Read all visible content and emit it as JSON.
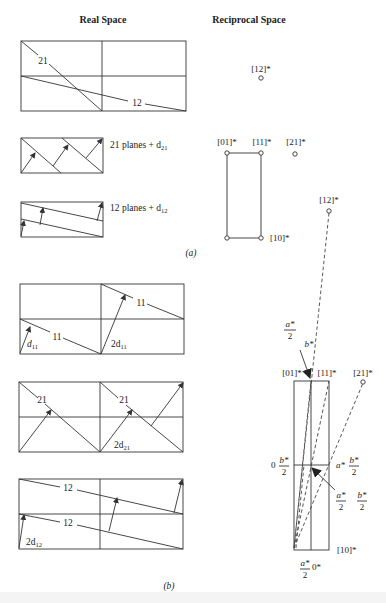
{
  "headers": {
    "real_space": "Real Space",
    "reciprocal_space": "Reciprocal Space"
  },
  "part_a": {
    "caption": "(a)",
    "real": {
      "panel1_labels": [
        "21",
        "12"
      ],
      "panel2_label": "21 planes + d",
      "panel2_sub": "21",
      "panel3_label": "12 planes + d",
      "panel3_sub": "12"
    },
    "reciprocal": {
      "points": [
        {
          "label": "[12]*"
        },
        {
          "label": "[01]*"
        },
        {
          "label": "[11]*"
        },
        {
          "label": "[21]*"
        },
        {
          "label": "[12]*"
        },
        {
          "label": "[10]*"
        }
      ]
    }
  },
  "part_b": {
    "caption": "(b)",
    "real": {
      "panel1_labels": [
        "11",
        "11"
      ],
      "panel1_d": "d",
      "panel1_d_sub": "11",
      "panel1_2d": "2d",
      "panel1_2d_sub": "11",
      "panel2_labels": [
        "21",
        "21"
      ],
      "panel2_2d": "2d",
      "panel2_2d_sub": "21",
      "panel3_labels": [
        "12",
        "12"
      ],
      "panel3_2d": "2d",
      "panel3_2d_sub": "12"
    },
    "reciprocal": {
      "labels": {
        "a_half_num": "a*",
        "a_half_den": "2",
        "b_star": "b*",
        "p01": "[01]*",
        "p11": "[11]*",
        "p21": "[21]*",
        "zero": "0",
        "b_half_num": "b*",
        "b_half_den": "2",
        "a_star": "a*",
        "b_half2_num": "b*",
        "b_half2_den": "2",
        "a_half2_num": "a*",
        "a_half2_den": "2",
        "b_half3_num": "b*",
        "b_half3_den": "2",
        "p10": "[10]*",
        "a_half3_num": "a*",
        "a_half3_den": "2",
        "zero_star": "0*"
      }
    }
  }
}
